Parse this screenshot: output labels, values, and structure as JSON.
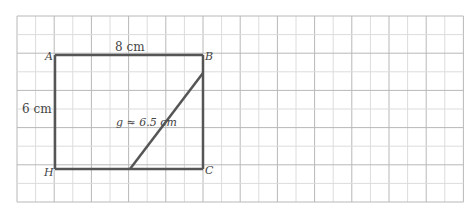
{
  "figure": {
    "type": "geometry-diagram",
    "grid": {
      "x0": 17,
      "y0": 16,
      "cols": 24,
      "rows": 10,
      "step": 18.6,
      "minor_color": "#dcdcdc",
      "major_color": "#b8b8b8"
    },
    "shape_color": "#555555",
    "vertices": {
      "A": {
        "label": "A",
        "x": 55,
        "y": 55
      },
      "B": {
        "label": "B",
        "x": 203,
        "y": 55
      },
      "C": {
        "label": "C",
        "x": 203,
        "y": 169
      },
      "H": {
        "label": "H",
        "x": 55,
        "y": 169
      }
    },
    "segment_g": {
      "x1": 130,
      "y1": 169,
      "x2": 203,
      "y2": 73
    },
    "labels": {
      "top": "8 cm",
      "left": "6 cm",
      "diagonal": "g ≈ 6.5 cm"
    }
  }
}
